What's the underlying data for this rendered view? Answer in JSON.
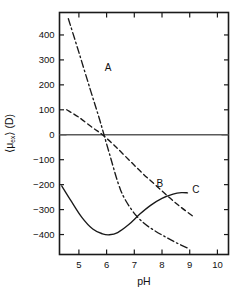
{
  "chart_data": {
    "type": "line",
    "title": "",
    "xlabel": "pH",
    "ylabel": "⟨μ_ex⟩ (D)",
    "ylabel_parts": {
      "bracket_open": "⟨",
      "mu": "μ",
      "subscript": "ex",
      "bracket_close": "⟩",
      "units": "(D)"
    },
    "xlim": [
      4.3,
      10.4
    ],
    "ylim": [
      -480,
      490
    ],
    "xticks": [
      5,
      6,
      7,
      8,
      9,
      10
    ],
    "xtick_labels": [
      "5",
      "6",
      "7",
      "8",
      "9",
      "10"
    ],
    "yticks": [
      -400,
      -300,
      -200,
      -100,
      0,
      100,
      200,
      300,
      400
    ],
    "ytick_labels": [
      "−400",
      "−300",
      "−200",
      "−100",
      "0",
      "100",
      "200",
      "300",
      "400"
    ],
    "grid": false,
    "legend": "inline-curve-labels",
    "zero_reference_line": true,
    "series": [
      {
        "name": "A",
        "label": "A",
        "style": "dash-dot",
        "label_x": 6.05,
        "label_y": 268,
        "x": [
          4.62,
          5.0,
          5.4,
          5.75,
          6.1,
          6.5,
          6.9,
          7.3,
          7.7,
          8.1,
          8.5,
          9.0
        ],
        "y": [
          465,
          330,
          185,
          60,
          -75,
          -220,
          -300,
          -350,
          -382,
          -408,
          -432,
          -458
        ]
      },
      {
        "name": "B",
        "label": "B",
        "style": "dashed",
        "label_x": 7.92,
        "label_y": -200,
        "x": [
          4.56,
          5.0,
          5.5,
          5.85,
          6.3,
          6.8,
          7.3,
          7.8,
          8.3,
          8.7,
          9.1
        ],
        "y": [
          100,
          70,
          28,
          0,
          -45,
          -100,
          -155,
          -205,
          -255,
          -292,
          -325
        ]
      },
      {
        "name": "C",
        "label": "C",
        "style": "solid",
        "label_x": 9.22,
        "label_y": -222,
        "x": [
          4.38,
          4.7,
          5.1,
          5.5,
          5.85,
          6.1,
          6.4,
          6.8,
          7.2,
          7.6,
          8.0,
          8.4,
          8.7,
          8.92
        ],
        "y": [
          -205,
          -262,
          -330,
          -378,
          -397,
          -401,
          -392,
          -360,
          -318,
          -282,
          -255,
          -238,
          -232,
          -233
        ]
      }
    ]
  }
}
